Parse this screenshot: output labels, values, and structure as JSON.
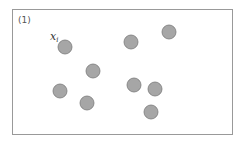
{
  "diagram": {
    "panel_label": "(1)",
    "point_label": {
      "base": "x",
      "subscript": "i",
      "x": 50,
      "y": 40
    },
    "frame": {
      "x": 12.5,
      "y": 9.5,
      "width": 220,
      "height": 125,
      "stroke": "#999999"
    },
    "point_style": {
      "radius": 7,
      "fill": "#a6a6a6",
      "stroke": "#7a7a7a"
    },
    "points": [
      {
        "x": 65,
        "y": 47
      },
      {
        "x": 93,
        "y": 71
      },
      {
        "x": 131,
        "y": 42
      },
      {
        "x": 169,
        "y": 32
      },
      {
        "x": 60,
        "y": 91
      },
      {
        "x": 87,
        "y": 103
      },
      {
        "x": 134,
        "y": 85
      },
      {
        "x": 155,
        "y": 89
      },
      {
        "x": 151,
        "y": 112
      }
    ]
  }
}
